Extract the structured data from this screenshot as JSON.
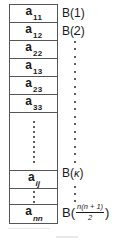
{
  "figure": {
    "type": "packed-symmetric-matrix-storage-diagram"
  },
  "array": {
    "name": "packed-array-column",
    "cells": [
      {
        "kind": "element",
        "base": "a",
        "sub": "11",
        "sub_style": "upright"
      },
      {
        "kind": "element",
        "base": "a",
        "sub": "12",
        "sub_style": "upright"
      },
      {
        "kind": "element",
        "base": "a",
        "sub": "22",
        "sub_style": "upright"
      },
      {
        "kind": "element",
        "base": "a",
        "sub": "13",
        "sub_style": "upright"
      },
      {
        "kind": "element",
        "base": "a",
        "sub": "23",
        "sub_style": "upright"
      },
      {
        "kind": "element",
        "base": "a",
        "sub": "33",
        "sub_style": "upright"
      },
      {
        "kind": "ellipsis",
        "dots": 9,
        "size": "tall"
      },
      {
        "kind": "element",
        "base": "a",
        "sub": "ij",
        "sub_style": "italic"
      },
      {
        "kind": "ellipsis",
        "dots": 3,
        "size": "short"
      },
      {
        "kind": "element",
        "base": "a",
        "sub": "nn",
        "sub_style": "italic"
      }
    ]
  },
  "labels": {
    "name": "storage-index-labels",
    "first": "B(1)",
    "second": "B(2)",
    "kappa_prefix": "B(",
    "kappa_symbol": "κ",
    "kappa_suffix": ")",
    "last_prefix": "B(",
    "last_numerator": "n(n + 1)",
    "last_denominator": "2",
    "last_suffix": ")",
    "connector_dots_upper": 18,
    "connector_dots_lower": 3
  },
  "style": {
    "background": "#ffffff",
    "border_color": "#555555",
    "text_color": "#1a1a1a",
    "dot_color": "#2a2a2a"
  }
}
